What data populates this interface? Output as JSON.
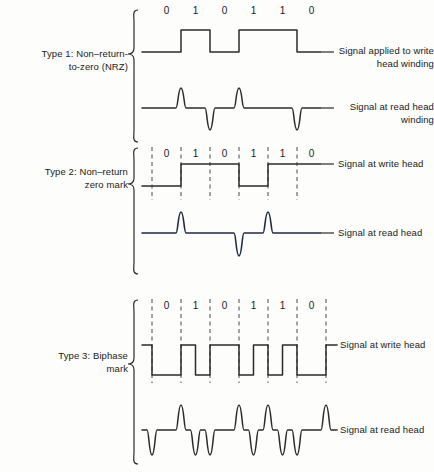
{
  "figure": {
    "bit_sequence": [
      "0",
      "1",
      "0",
      "1",
      "1",
      "0"
    ],
    "line_color": "#2b2b2b",
    "accent_color": "#1f2a44",
    "background": "#fdfdfb"
  },
  "sections": [
    {
      "id": "type1",
      "label": "Type 1:  Non–return-\nto-zero (NRZ)",
      "bits": [
        "0",
        "1",
        "0",
        "1",
        "1",
        "0"
      ],
      "show_cell_dividers": false,
      "waveforms": [
        {
          "id": "type1-write",
          "label": "Signal applied to write\nhead winding",
          "kind": "write",
          "encoding": "nrz",
          "levels": [
            0,
            1,
            0,
            1,
            1,
            0
          ],
          "color": "#2b2b2b"
        },
        {
          "id": "type1-read",
          "label": "Signal at read head\nwinding",
          "kind": "read",
          "encoding": "nrz-derivative",
          "pulses": [
            {
              "cell": 1,
              "position": "start",
              "direction": "up"
            },
            {
              "cell": 2,
              "position": "start",
              "direction": "down"
            },
            {
              "cell": 3,
              "position": "start",
              "direction": "up"
            },
            {
              "cell": 5,
              "position": "start",
              "direction": "down"
            }
          ],
          "color": "#2b2b2b"
        }
      ]
    },
    {
      "id": "type2",
      "label": "Type 2:  Non–return\nzero mark",
      "bits": [
        "0",
        "1",
        "0",
        "1",
        "1",
        "0"
      ],
      "show_cell_dividers": true,
      "waveforms": [
        {
          "id": "type2-write",
          "label": "Signal at write head",
          "kind": "write",
          "encoding": "nrz-mark",
          "levels": [
            0,
            1,
            1,
            0,
            1,
            1
          ],
          "color": "#2b2b2b"
        },
        {
          "id": "type2-read",
          "label": "Signal at read head",
          "kind": "read",
          "encoding": "nrz-mark-derivative",
          "pulses": [
            {
              "cell": 1,
              "position": "start",
              "direction": "up"
            },
            {
              "cell": 3,
              "position": "start",
              "direction": "down"
            },
            {
              "cell": 4,
              "position": "start",
              "direction": "up"
            }
          ],
          "color": "#1f2a44"
        }
      ]
    },
    {
      "id": "type3",
      "label": "Type 3:  Biphase\nmark",
      "bits": [
        "0",
        "1",
        "0",
        "1",
        "1",
        "0"
      ],
      "show_cell_dividers": true,
      "waveforms": [
        {
          "id": "type3-write",
          "label": "Signal at write head",
          "kind": "write",
          "encoding": "biphase-mark",
          "note": "Transition at every cell boundary; additional mid-cell transition for each 1 bit",
          "color": "#2b2b2b"
        },
        {
          "id": "type3-read",
          "label": "Signal at read head",
          "kind": "read",
          "encoding": "biphase-mark-derivative",
          "note": "Alternating up/down pulse at every transition of the write waveform",
          "color": "#2b2b2b"
        }
      ]
    }
  ]
}
